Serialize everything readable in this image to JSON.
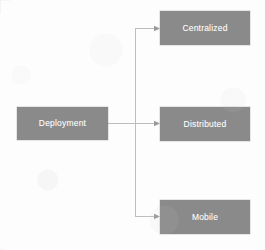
{
  "diagram": {
    "type": "hierarchy-tree",
    "title": "Deployment",
    "background_color": "#fdfdfd",
    "node_fill_color": "#8a8a8a",
    "node_text_color": "#ffffff",
    "connector_color": "#b9b9b9",
    "arrow_color": "#8f8f8f",
    "root": {
      "id": "deployment",
      "label": "Deployment",
      "x": 17,
      "y": 107,
      "width": 91,
      "height": 33
    },
    "children": [
      {
        "id": "centralized",
        "label": "Centralized",
        "x": 160,
        "y": 11,
        "width": 90,
        "height": 34
      },
      {
        "id": "distributed",
        "label": "Distributed",
        "x": 160,
        "y": 107,
        "width": 90,
        "height": 34
      },
      {
        "id": "mobile",
        "label": "Mobile",
        "x": 160,
        "y": 200,
        "width": 90,
        "height": 34
      }
    ],
    "edges": [
      {
        "id": "edge-deployment-centralized",
        "from": "deployment",
        "to": "centralized"
      },
      {
        "id": "edge-deployment-distributed",
        "from": "deployment",
        "to": "distributed"
      },
      {
        "id": "edge-deployment-mobile",
        "from": "deployment",
        "to": "mobile"
      }
    ],
    "trunk": {
      "x": 135,
      "top_y": 28,
      "bottom_y": 217,
      "stem_y": 123
    }
  }
}
